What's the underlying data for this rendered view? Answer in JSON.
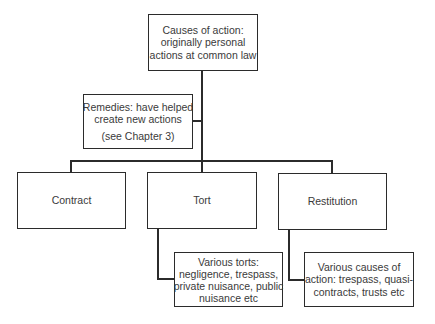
{
  "diagram": {
    "root": {
      "lines": [
        "Causes of action:",
        "originally personal",
        "actions at common law"
      ]
    },
    "remedies": {
      "lines": [
        "Remedies: have helped",
        "create new actions"
      ],
      "note": "(see Chapter 3)"
    },
    "branches": [
      {
        "label": "Contract"
      },
      {
        "label": "Tort",
        "child": {
          "lines": [
            "Various torts:",
            "negligence, trespass,",
            "private nuisance, public",
            "nuisance etc"
          ]
        }
      },
      {
        "label": "Restitution",
        "child": {
          "lines": [
            "Various causes of",
            "action: trespass, quasi-",
            "contracts, trusts etc"
          ]
        }
      }
    ]
  }
}
